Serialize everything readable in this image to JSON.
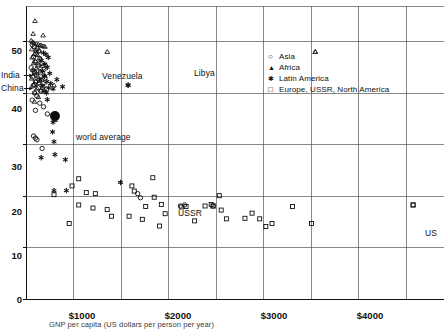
{
  "chart_data": {
    "type": "scatter",
    "title": "",
    "xlabel": "GNP per capita (US dollars per person per year)",
    "ylabel": "",
    "xlim": [
      0,
      4400
    ],
    "ylim": [
      0,
      57
    ],
    "grid": true,
    "xticks": [
      0,
      1000,
      2000,
      3000,
      4000
    ],
    "xticklabels": [
      "",
      "$1000",
      "$2000",
      "$3000",
      "$4000"
    ],
    "xgridlines": [
      500,
      1000,
      1500,
      2000,
      2500,
      3000,
      3500,
      4000
    ],
    "yticks": [
      0,
      10,
      20,
      30,
      40,
      50
    ],
    "yticklabels": [
      "0",
      "10",
      "20",
      "30",
      "40",
      "50"
    ],
    "legend_position": "top-right",
    "series": [
      {
        "name": "Asia",
        "marker": "open-circle",
        "points": [
          [
            70,
            49.4
          ],
          [
            95,
            49.0
          ],
          [
            120,
            48.6
          ],
          [
            140,
            48.2
          ],
          [
            110,
            47.5
          ],
          [
            85,
            47.0
          ],
          [
            150,
            46.6
          ],
          [
            100,
            46.0
          ],
          [
            175,
            45.8
          ],
          [
            130,
            45.2
          ],
          [
            60,
            44.9
          ],
          [
            195,
            44.6
          ],
          [
            90,
            44.2
          ],
          [
            160,
            43.9
          ],
          [
            115,
            43.5
          ],
          [
            75,
            43.1
          ],
          [
            205,
            42.9
          ],
          [
            145,
            42.5
          ],
          [
            105,
            42.1
          ],
          [
            185,
            41.8
          ],
          [
            80,
            41.4
          ],
          [
            135,
            41.0
          ],
          [
            220,
            40.7
          ],
          [
            165,
            40.3
          ],
          [
            95,
            40.0
          ],
          [
            120,
            39.4
          ],
          [
            70,
            38.6
          ],
          [
            150,
            38.0
          ],
          [
            190,
            37.3
          ],
          [
            105,
            36.6
          ],
          [
            230,
            35.9
          ],
          [
            85,
            31.6
          ],
          [
            105,
            31.2
          ],
          [
            120,
            30.9
          ],
          [
            175,
            29.2
          ],
          [
            1180,
            20.4
          ],
          [
            1210,
            19.6
          ],
          [
            1630,
            18.0
          ],
          [
            1675,
            18.2
          ]
        ]
      },
      {
        "name": "Africa",
        "marker": "filled-triangle",
        "points": [
          [
            100,
            54.0
          ],
          [
            80,
            51.5
          ],
          [
            185,
            51.2
          ],
          [
            60,
            50.2
          ],
          [
            75,
            49.9
          ],
          [
            90,
            49.7
          ],
          [
            115,
            49.5
          ],
          [
            135,
            49.4
          ],
          [
            155,
            49.3
          ],
          [
            170,
            49.2
          ],
          [
            190,
            49.1
          ],
          [
            205,
            49.0
          ],
          [
            65,
            48.5
          ],
          [
            110,
            48.3
          ],
          [
            145,
            48.1
          ],
          [
            95,
            47.6
          ],
          [
            125,
            47.4
          ],
          [
            70,
            46.9
          ],
          [
            160,
            46.7
          ],
          [
            105,
            46.2
          ],
          [
            85,
            45.8
          ],
          [
            140,
            45.5
          ],
          [
            180,
            45.3
          ],
          [
            115,
            44.8
          ],
          [
            75,
            44.5
          ],
          [
            150,
            44.2
          ],
          [
            95,
            43.8
          ],
          [
            200,
            43.5
          ],
          [
            130,
            43.2
          ],
          [
            65,
            42.8
          ],
          [
            170,
            42.6
          ],
          [
            110,
            42.3
          ],
          [
            145,
            41.9
          ],
          [
            85,
            41.6
          ],
          [
            190,
            41.3
          ],
          [
            120,
            40.9
          ],
          [
            160,
            40.5
          ],
          [
            100,
            40.1
          ],
          [
            135,
            39.2
          ],
          [
            95,
            38.3
          ],
          [
            300,
            41.5
          ],
          [
            860,
            48.0
          ],
          [
            3050,
            48.0
          ]
        ]
      },
      {
        "name": "Latin America",
        "marker": "asterisk",
        "points": [
          [
            190,
            47.8
          ],
          [
            215,
            47.5
          ],
          [
            240,
            46.9
          ],
          [
            165,
            46.3
          ],
          [
            205,
            45.6
          ],
          [
            230,
            45.0
          ],
          [
            180,
            44.3
          ],
          [
            255,
            43.8
          ],
          [
            200,
            43.2
          ],
          [
            150,
            42.6
          ],
          [
            225,
            42.2
          ],
          [
            265,
            41.8
          ],
          [
            175,
            41.4
          ],
          [
            245,
            41.0
          ],
          [
            290,
            40.8
          ],
          [
            195,
            40.4
          ],
          [
            220,
            40.0
          ],
          [
            330,
            42.6
          ],
          [
            390,
            41.2
          ],
          [
            1080,
            41.5
          ],
          [
            230,
            38.7
          ],
          [
            290,
            34.3
          ],
          [
            285,
            32.4
          ],
          [
            300,
            30.5
          ],
          [
            310,
            28.0
          ],
          [
            165,
            27.4
          ],
          [
            420,
            27.0
          ],
          [
            300,
            21.0
          ],
          [
            430,
            21.0
          ],
          [
            1000,
            22.6
          ]
        ]
      },
      {
        "name": "Europe, USSR, North America",
        "marker": "open-square",
        "points": [
          [
            310,
            34.8
          ],
          [
            560,
            23.3
          ],
          [
            490,
            21.9
          ],
          [
            300,
            20.2
          ],
          [
            640,
            20.6
          ],
          [
            735,
            20.4
          ],
          [
            1120,
            21.9
          ],
          [
            1145,
            20.9
          ],
          [
            1340,
            23.5
          ],
          [
            1355,
            19.7
          ],
          [
            560,
            18.2
          ],
          [
            710,
            17.6
          ],
          [
            1430,
            18.3
          ],
          [
            1470,
            16.5
          ],
          [
            1890,
            18.0
          ],
          [
            1955,
            18.3
          ],
          [
            1975,
            18.0
          ],
          [
            2060,
            17.2
          ],
          [
            2115,
            15.5
          ],
          [
            2310,
            15.6
          ],
          [
            2385,
            16.6
          ],
          [
            2465,
            15.5
          ],
          [
            2530,
            14.0
          ],
          [
            2595,
            14.6
          ],
          [
            1090,
            16.0
          ],
          [
            1230,
            15.4
          ],
          [
            1265,
            17.9
          ],
          [
            1410,
            14.1
          ],
          [
            1640,
            17.8
          ],
          [
            1690,
            17.9
          ],
          [
            2040,
            20.0
          ],
          [
            2810,
            17.9
          ],
          [
            3010,
            14.6
          ],
          [
            4080,
            18.2
          ],
          [
            860,
            17.3
          ],
          [
            905,
            16.0
          ],
          [
            1780,
            15.1
          ],
          [
            460,
            14.6
          ]
        ]
      }
    ],
    "special_points": [
      {
        "label": "world average",
        "marker": "large-filled-circle",
        "x": 310,
        "y": 35.5
      },
      {
        "label": "India",
        "marker": "open-circle",
        "x": 95,
        "y": 44.0
      },
      {
        "label": "China",
        "marker": "open-circle",
        "x": 95,
        "y": 41.6
      },
      {
        "label": "Venezuela",
        "marker": "asterisk",
        "x": 1080,
        "y": 41.5
      },
      {
        "label": "Libya",
        "marker": "filled-triangle",
        "x": 3050,
        "y": 48.0
      },
      {
        "label": "USSR",
        "marker": "open-square",
        "x": 1975,
        "y": 18.0
      },
      {
        "label": "US",
        "marker": "open-square",
        "x": 4080,
        "y": 18.2
      }
    ]
  },
  "axes": {
    "y_tick_labels": [
      "50",
      "40",
      "30",
      "20",
      "10",
      "0"
    ],
    "x_tick_labels": [
      "$1000",
      "$2000",
      "$3000",
      "$4000"
    ]
  },
  "legend": {
    "items": [
      {
        "symbol": "○",
        "label": "Asia",
        "marker": "open-circle"
      },
      {
        "symbol": "▲",
        "label": "Africa",
        "marker": "filled-triangle"
      },
      {
        "symbol": "✱",
        "label": "Latin America",
        "marker": "asterisk"
      },
      {
        "symbol": "□",
        "label": "Europe, USSR, North America",
        "marker": "open-square"
      }
    ]
  },
  "annotations": {
    "india": "India",
    "china": "China",
    "venezuela": "Venezuela",
    "libya": "Libya",
    "world_average": "world average",
    "ussr": "USSR",
    "us": "US"
  },
  "caption": {
    "text": "GNP per capita (US dollars per person per year)"
  }
}
